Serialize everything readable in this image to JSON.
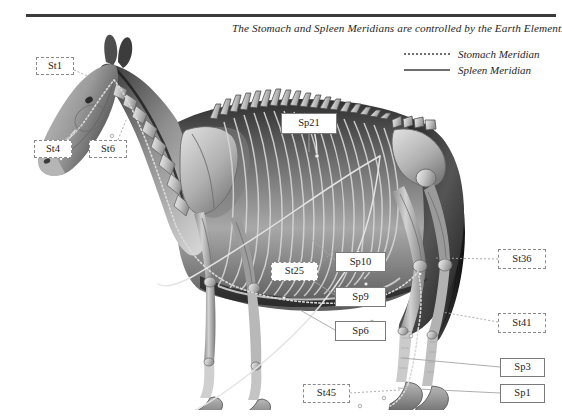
{
  "header": {
    "title": "The Stomach and Spleen Meridians are controlled by the Earth Element."
  },
  "legend": {
    "items": [
      {
        "label": "Stomach Meridian",
        "style": "dotted",
        "color": "#6e6e6e"
      },
      {
        "label": "Spleen Meridian",
        "style": "solid",
        "color": "#6e6e6e"
      }
    ]
  },
  "illustration": {
    "subject": "horse-anatomical-skeleton-lateral-view",
    "alt": "Lateral anatomical illustration of a horse with skeletal overlay showing meridian pathways"
  },
  "callouts": [
    {
      "id": "St1",
      "label": "St1",
      "meridian": "stomach",
      "x": 36,
      "y": 57,
      "w": 38,
      "h": 18
    },
    {
      "id": "St4",
      "label": "St4",
      "meridian": "stomach",
      "x": 34,
      "y": 140,
      "w": 38,
      "h": 18
    },
    {
      "id": "St6",
      "label": "St6",
      "meridian": "stomach",
      "x": 89,
      "y": 140,
      "w": 38,
      "h": 18
    },
    {
      "id": "Sp21",
      "label": "Sp21",
      "meridian": "spleen",
      "x": 281,
      "y": 113,
      "w": 56,
      "h": 21
    },
    {
      "id": "St25",
      "label": "St25",
      "meridian": "stomach",
      "x": 271,
      "y": 262,
      "w": 47,
      "h": 19
    },
    {
      "id": "Sp10",
      "label": "Sp10",
      "meridian": "spleen",
      "x": 335,
      "y": 252,
      "w": 51,
      "h": 20
    },
    {
      "id": "Sp9",
      "label": "Sp9",
      "meridian": "spleen",
      "x": 335,
      "y": 287,
      "w": 51,
      "h": 20
    },
    {
      "id": "Sp6",
      "label": "Sp6",
      "meridian": "spleen",
      "x": 335,
      "y": 321,
      "w": 51,
      "h": 20
    },
    {
      "id": "St36",
      "label": "St36",
      "meridian": "stomach",
      "x": 498,
      "y": 249,
      "w": 48,
      "h": 20
    },
    {
      "id": "St41",
      "label": "St41",
      "meridian": "stomach",
      "x": 498,
      "y": 313,
      "w": 48,
      "h": 20
    },
    {
      "id": "Sp3",
      "label": "Sp3",
      "meridian": "spleen",
      "x": 500,
      "y": 358,
      "w": 45,
      "h": 19
    },
    {
      "id": "Sp1",
      "label": "Sp1",
      "meridian": "spleen",
      "x": 500,
      "y": 384,
      "w": 45,
      "h": 19
    },
    {
      "id": "St45",
      "label": "St45",
      "meridian": "stomach",
      "x": 303,
      "y": 384,
      "w": 47,
      "h": 19
    }
  ],
  "colors": {
    "rule": "#3b3b3b",
    "text": "#1c1c1c",
    "stomach_border": "#8a8a8a",
    "spleen_border": "#7a7a7a",
    "connector": "#9a9a9a",
    "background": "#ffffff"
  }
}
